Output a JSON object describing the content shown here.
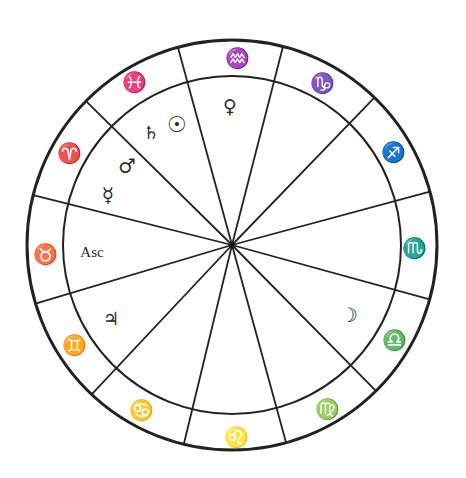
{
  "chart_data": {
    "type": "diagram",
    "title": "",
    "geometry": {
      "center": [
        232,
        245
      ],
      "outer_radius": 205,
      "inner_radius": 169
    },
    "colors": {
      "line": "#222222",
      "glyph": "#2a2a2a",
      "background": "#ffffff"
    },
    "cusp_angles_deg": [
      105.3,
      75.6,
      46.0,
      15.1,
      -15.4,
      -45.4,
      -74.7,
      -103.6,
      -133.2,
      -163.4,
      165.9,
      135.4
    ],
    "signs": [
      {
        "name": "Aquarius",
        "glyph": "♒",
        "x": 237,
        "y": 58,
        "size": 20
      },
      {
        "name": "Capricorn",
        "glyph": "♑",
        "x": 322,
        "y": 83,
        "size": 20
      },
      {
        "name": "Sagittarius",
        "glyph": "♐",
        "x": 393,
        "y": 152,
        "size": 20
      },
      {
        "name": "Scorpio",
        "glyph": "♏",
        "x": 414,
        "y": 248,
        "size": 20
      },
      {
        "name": "Libra",
        "glyph": "♎",
        "x": 394,
        "y": 340,
        "size": 20
      },
      {
        "name": "Virgo",
        "glyph": "♍",
        "x": 327,
        "y": 409,
        "size": 20
      },
      {
        "name": "Leo",
        "glyph": "♌",
        "x": 236,
        "y": 437,
        "size": 20
      },
      {
        "name": "Cancer",
        "glyph": "♋",
        "x": 141,
        "y": 410,
        "size": 20
      },
      {
        "name": "Gemini",
        "glyph": "♊",
        "x": 74,
        "y": 345,
        "size": 20
      },
      {
        "name": "Taurus",
        "glyph": "♉",
        "x": 45,
        "y": 254,
        "size": 20
      },
      {
        "name": "Aries",
        "glyph": "♈",
        "x": 69,
        "y": 153,
        "size": 20
      },
      {
        "name": "Pisces",
        "glyph": "♓",
        "x": 134,
        "y": 82,
        "size": 20
      }
    ],
    "planets": [
      {
        "name": "Venus",
        "glyph": "♀",
        "x": 230,
        "y": 106,
        "size": 19
      },
      {
        "name": "Sun",
        "glyph": "☉",
        "x": 177,
        "y": 124,
        "size": 22
      },
      {
        "name": "Saturn",
        "glyph": "♄",
        "x": 151,
        "y": 132,
        "size": 18
      },
      {
        "name": "Mars",
        "glyph": "♂",
        "x": 127,
        "y": 166,
        "size": 20
      },
      {
        "name": "Mercury",
        "glyph": "☿",
        "x": 108,
        "y": 195,
        "size": 20
      },
      {
        "name": "Jupiter",
        "glyph": "♃",
        "x": 111,
        "y": 318,
        "size": 18
      },
      {
        "name": "Moon",
        "glyph": "☽",
        "x": 349,
        "y": 315,
        "size": 20
      }
    ],
    "labels": [
      {
        "name": "Ascendant",
        "text": "Asc",
        "x": 92,
        "y": 252,
        "size": 15
      }
    ]
  }
}
